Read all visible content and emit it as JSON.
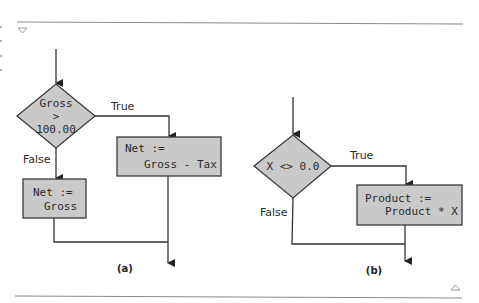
{
  "colors": {
    "shape_fill": "#c9c9c9",
    "line": "#333333",
    "rule": "#8a8a8a",
    "background": "#ffffff"
  },
  "page_markers": {
    "top_icon": "down-triangle-icon",
    "bottom_icon": "up-triangle-icon"
  },
  "diagram_a": {
    "caption": "(a)",
    "decision": {
      "line1": "Gross",
      "line2": ">",
      "line3": "100.00"
    },
    "true_label": "True",
    "false_label": "False",
    "true_box": {
      "line1": "Net :=",
      "line2": "Gross - Tax"
    },
    "false_box": {
      "line1": "Net :=",
      "line2": "Gross"
    }
  },
  "diagram_b": {
    "caption": "(b)",
    "decision": {
      "line1": "X <> 0.0"
    },
    "true_label": "True",
    "false_label": "False",
    "true_box": {
      "line1": "Product :=",
      "line2": "Product * X"
    }
  }
}
